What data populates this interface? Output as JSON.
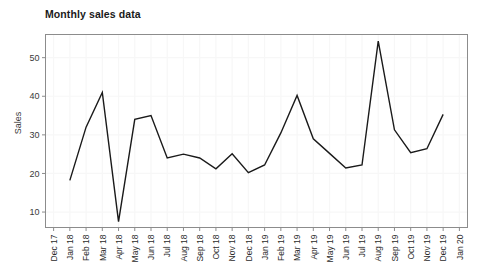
{
  "chart_data": {
    "type": "line",
    "title": "Monthly sales data",
    "xlabel": "",
    "ylabel": "Sales",
    "grid": true,
    "legend": "none",
    "ylim": [
      6,
      56
    ],
    "yticks": [
      10,
      20,
      30,
      40,
      50
    ],
    "xticks": [
      "Dec 17",
      "Jan 18",
      "Feb 18",
      "Mar 18",
      "Apr 18",
      "May 18",
      "Jun 18",
      "Jul 18",
      "Aug 18",
      "Sep 18",
      "Oct 18",
      "Nov 18",
      "Dec 18",
      "Jan 19",
      "Feb 19",
      "Mar 19",
      "Apr 19",
      "May 19",
      "Jun 19",
      "Jul 19",
      "Aug 19",
      "Sep 19",
      "Oct 19",
      "Nov 19",
      "Dec 19",
      "Jan 20"
    ],
    "categories": [
      "Jan 18",
      "Feb 18",
      "Mar 18",
      "Apr 18",
      "May 18",
      "Jun 18",
      "Jul 18",
      "Aug 18",
      "Sep 18",
      "Oct 18",
      "Nov 18",
      "Dec 18",
      "Jan 19",
      "Feb 19",
      "Mar 19",
      "Apr 19",
      "May 19",
      "Jun 19",
      "Jul 19",
      "Aug 19",
      "Sep 19",
      "Oct 19",
      "Nov 19",
      "Dec 19"
    ],
    "values": [
      18.2,
      32.0,
      41.0,
      7.5,
      34.0,
      35.0,
      24.0,
      25.0,
      24.0,
      21.2,
      25.1,
      20.2,
      22.2,
      30.5,
      40.2,
      29.0,
      25.2,
      21.4,
      22.2,
      54.3,
      31.3,
      25.4,
      26.4,
      35.3
    ],
    "series": [
      {
        "name": "Sales",
        "color": "#1a1a1a",
        "values": [
          18.2,
          32.0,
          41.0,
          7.5,
          34.0,
          35.0,
          24.0,
          25.0,
          24.0,
          21.2,
          25.1,
          20.2,
          22.2,
          30.5,
          40.2,
          29.0,
          25.2,
          21.4,
          22.2,
          54.3,
          31.3,
          25.4,
          26.4,
          35.3
        ]
      }
    ]
  },
  "colors": {
    "line": "#1a1a1a",
    "frame": "#8c8c8c",
    "grid": "#f7f7f7",
    "text": "#2b2b2b",
    "background": "#ffffff"
  }
}
